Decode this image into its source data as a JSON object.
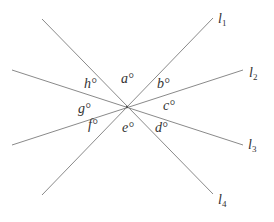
{
  "diagram": {
    "type": "intersecting-lines",
    "center": [
      127,
      107
    ],
    "line_color": "#8a8a8a",
    "text_color": "#333333",
    "lines": [
      {
        "name": "l",
        "sub": "1",
        "x1": 42,
        "y1": 195,
        "x2": 213,
        "y2": 18,
        "label_x": 218,
        "label_y": 12
      },
      {
        "name": "l",
        "sub": "2",
        "x1": 12,
        "y1": 145,
        "x2": 243,
        "y2": 70,
        "label_x": 249,
        "label_y": 66
      },
      {
        "name": "l",
        "sub": "3",
        "x1": 12,
        "y1": 70,
        "x2": 243,
        "y2": 145,
        "label_x": 248,
        "label_y": 138
      },
      {
        "name": "l",
        "sub": "4",
        "x1": 42,
        "y1": 19,
        "x2": 213,
        "y2": 194,
        "label_x": 218,
        "label_y": 193
      }
    ],
    "angles": [
      {
        "text": "a°",
        "x": 121,
        "y": 72
      },
      {
        "text": "b°",
        "x": 157,
        "y": 77
      },
      {
        "text": "c°",
        "x": 163,
        "y": 99
      },
      {
        "text": "d°",
        "x": 155,
        "y": 121
      },
      {
        "text": "e°",
        "x": 122,
        "y": 121
      },
      {
        "text": "f°",
        "x": 88,
        "y": 118
      },
      {
        "text": "g°",
        "x": 78,
        "y": 102
      },
      {
        "text": "h°",
        "x": 84,
        "y": 77
      }
    ]
  }
}
